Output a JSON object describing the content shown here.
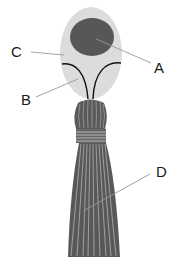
{
  "diagram": {
    "type": "labeled anatomical illustration",
    "labels": [
      {
        "id": "A",
        "text": "A",
        "points_to": "dark inner ellipse (top of oval head)"
      },
      {
        "id": "B",
        "text": "B",
        "points_to": "light region between curved lines (lower oval)"
      },
      {
        "id": "C",
        "text": "C",
        "points_to": "light outer oval region"
      },
      {
        "id": "D",
        "text": "D",
        "points_to": "striated tassel skirt"
      }
    ],
    "colors": {
      "outer_oval": "#dcdcdc",
      "inner_ellipse": "#555555",
      "curves": "#111111",
      "knot": "#5a5a5a",
      "band": "#666666",
      "skirt": "#585858",
      "strand_highlight": "#bdbdbd",
      "leader_line": "#999999",
      "label_text": "#1a1a1a"
    }
  }
}
